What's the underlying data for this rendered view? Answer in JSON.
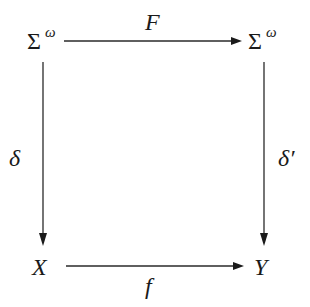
{
  "diagram": {
    "type": "commutative-square",
    "nodes": {
      "top_left": {
        "base": "Σ",
        "sup": "ω"
      },
      "top_right": {
        "base": "Σ",
        "sup": "ω"
      },
      "bottom_left": {
        "base": "X"
      },
      "bottom_right": {
        "base": "Y"
      }
    },
    "edges": {
      "top": {
        "label": "F",
        "from": "top_left",
        "to": "top_right"
      },
      "left": {
        "label": "δ",
        "from": "top_left",
        "to": "bottom_left"
      },
      "right": {
        "label": "δ′",
        "from": "top_right",
        "to": "bottom_right"
      },
      "bottom": {
        "label": "f",
        "from": "bottom_left",
        "to": "bottom_right"
      }
    },
    "colors": {
      "ink": "#1a1a1a",
      "background": "#ffffff"
    }
  }
}
